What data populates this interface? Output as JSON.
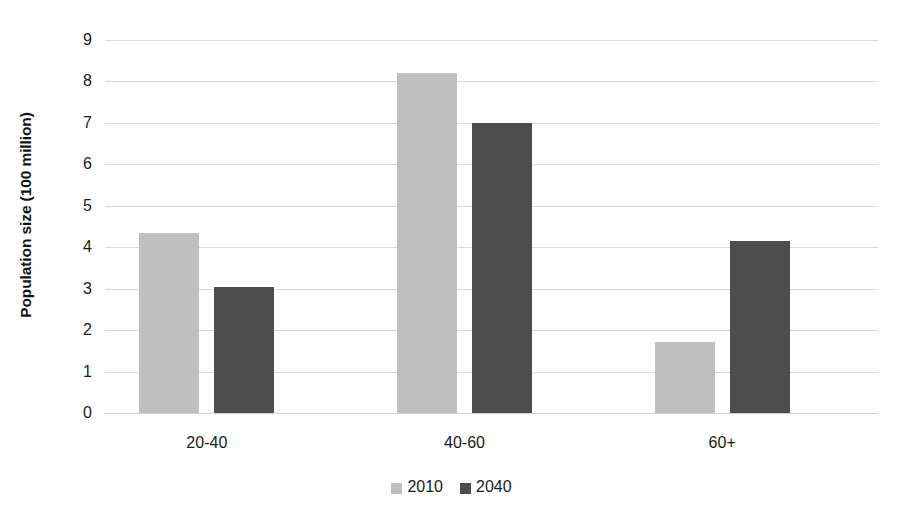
{
  "chart_data": {
    "type": "bar",
    "title": "",
    "xlabel": "",
    "ylabel": "Population size (100 million)",
    "categories": [
      "20-40",
      "40-60",
      "60+"
    ],
    "series": [
      {
        "name": "2010",
        "color": "#bfbfbf",
        "values": [
          4.35,
          8.2,
          1.72
        ]
      },
      {
        "name": "2040",
        "color": "#4d4d4d",
        "values": [
          3.04,
          7.0,
          4.15
        ]
      }
    ],
    "ylim": [
      0,
      9
    ],
    "y_ticks": [
      0,
      1,
      2,
      3,
      4,
      5,
      6,
      7,
      8,
      9
    ],
    "y_tick_labels": [
      "0",
      "1",
      "2",
      "3",
      "4",
      "5",
      "6",
      "7",
      "8",
      "9"
    ],
    "grid": true,
    "grid_color": "#d9d9d9",
    "legend_position": "bottom",
    "background_color": "#ffffff",
    "bar_group_gap": true
  },
  "legend": {
    "items": [
      {
        "label": "2010",
        "color": "#bfbfbf"
      },
      {
        "label": "2040",
        "color": "#4d4d4d"
      }
    ]
  }
}
